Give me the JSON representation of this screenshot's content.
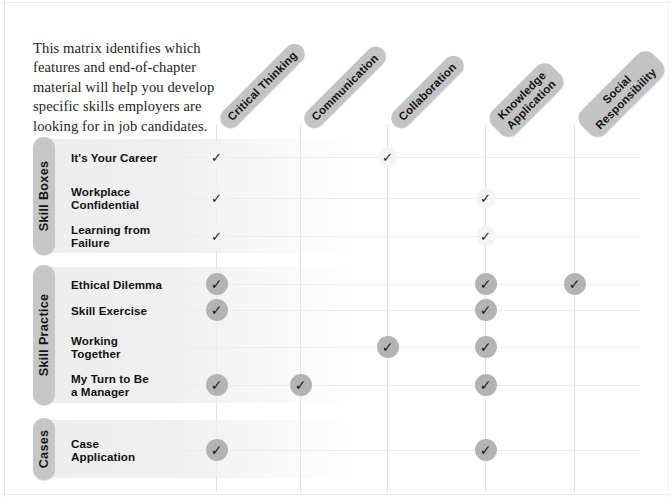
{
  "intro": {
    "text": "This matrix identifies which features and end-of-chapter material will help you develop specific skills employers are looking for in job candidates."
  },
  "colors": {
    "pill": "#c3c3c3",
    "check_solid": "#b3b3b3",
    "check_light": "#f4f4f4",
    "grid": "#e0e0e0"
  },
  "columns": [
    {
      "id": "critical-thinking",
      "label": "Critical Thinking",
      "line1": "Critical Thinking",
      "line2": ""
    },
    {
      "id": "communication",
      "label": "Communication",
      "line1": "Communication",
      "line2": ""
    },
    {
      "id": "collaboration",
      "label": "Collaboration",
      "line1": "Collaboration",
      "line2": ""
    },
    {
      "id": "knowledge-application",
      "label": "Knowledge Application",
      "line1": "Knowledge",
      "line2": "Application"
    },
    {
      "id": "social-responsibility",
      "label": "Social Responsibility",
      "line1": "Social",
      "line2": "Responsibility"
    }
  ],
  "sections": [
    {
      "id": "skill-boxes",
      "label": "Skill Boxes",
      "check_style": "light",
      "rows": [
        {
          "id": "its-your-career",
          "line1": "It's Your Career",
          "line2": "",
          "marks": [
            true,
            false,
            true,
            false,
            false
          ]
        },
        {
          "id": "workplace-confidential",
          "line1": "Workplace",
          "line2": "Confidential",
          "marks": [
            true,
            false,
            false,
            true,
            false
          ]
        },
        {
          "id": "learning-from-failure",
          "line1": "Learning from",
          "line2": "Failure",
          "marks": [
            true,
            false,
            false,
            true,
            false
          ]
        }
      ]
    },
    {
      "id": "skill-practice",
      "label": "Skill Practice",
      "check_style": "solid",
      "rows": [
        {
          "id": "ethical-dilemma",
          "line1": "Ethical Dilemma",
          "line2": "",
          "marks": [
            true,
            false,
            false,
            true,
            true
          ]
        },
        {
          "id": "skill-exercise",
          "line1": "Skill Exercise",
          "line2": "",
          "marks": [
            true,
            false,
            false,
            true,
            false
          ]
        },
        {
          "id": "working-together",
          "line1": "Working",
          "line2": "Together",
          "marks": [
            false,
            false,
            true,
            true,
            false
          ]
        },
        {
          "id": "my-turn-to-be-manager",
          "line1": "My Turn to Be",
          "line2": "a Manager",
          "marks": [
            true,
            true,
            false,
            true,
            false
          ]
        }
      ]
    },
    {
      "id": "cases",
      "label": "Cases",
      "check_style": "solid",
      "rows": [
        {
          "id": "case-application",
          "line1": "Case",
          "line2": "Application",
          "marks": [
            true,
            false,
            false,
            true,
            false
          ]
        }
      ]
    }
  ],
  "check_glyph": "✓"
}
